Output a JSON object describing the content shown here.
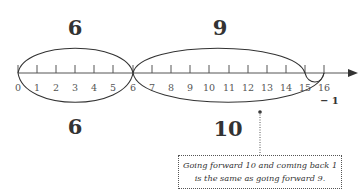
{
  "number_line": {
    "ticks": [
      "0",
      "1",
      "2",
      "3",
      "4",
      "5",
      "6",
      "7",
      "8",
      "9",
      "10",
      "11",
      "12",
      "13",
      "14",
      "15",
      "16"
    ]
  },
  "jumps": {
    "top_left": "6",
    "top_right": "9",
    "bottom_left": "6",
    "bottom_right": "10",
    "back_step": "− 1"
  },
  "callout": {
    "line1": "Going forward 10 and coming back 1",
    "line2": "is the same as going forward 9."
  }
}
